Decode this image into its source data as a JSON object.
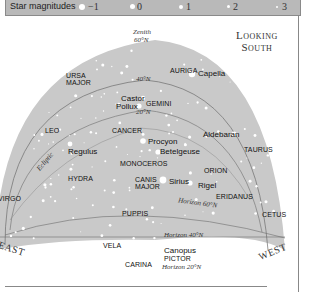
{
  "legend": {
    "title": "Star magnitudes",
    "items": [
      {
        "label": "−1",
        "magnitude": -1
      },
      {
        "label": "0",
        "magnitude": 0
      },
      {
        "label": "1",
        "magnitude": 1
      },
      {
        "label": "2",
        "magnitude": 2
      },
      {
        "label": "3",
        "magnitude": 3
      }
    ]
  },
  "view": {
    "title_line1": "Looking",
    "title_line2": "South"
  },
  "directions": {
    "east": "EAST",
    "west": "WEST"
  },
  "reference_lines": {
    "zenith": "Zenith",
    "zenith_lat": "60°N",
    "lat40": "40°N",
    "lat20": "20°N",
    "ecliptic": "Ecliptic",
    "horizon60": "Horizon 60°N",
    "horizon40": "Horizon 40°N",
    "horizon20": "Horizon 20°N"
  },
  "constellations": {
    "ursa_major_1": "URSA",
    "ursa_major_2": "MAJOR",
    "auriga": "AURIGA",
    "gemini": "GEMINI",
    "leo": "LEO",
    "cancer": "CANCER",
    "taurus": "TAURUS",
    "monoceros": "MONOCEROS",
    "orion": "ORION",
    "hydra": "HYDRA",
    "canis_major_1": "CANIS",
    "canis_major_2": "MAJOR",
    "eridanus": "ERIDANUS",
    "virgo": "VIRGO",
    "puppis": "PUPPIS",
    "cetus": "CETUS",
    "vela": "VELA",
    "pictor": "PICTOR",
    "carina": "CARINA"
  },
  "stars": {
    "capella": "Capella",
    "castor": "Castor",
    "pollux": "Pollux",
    "procyon": "Procyon",
    "betelgeuse": "Betelgeuse",
    "aldebaran": "Aldebaran",
    "regulus": "Regulus",
    "sirius": "Sirius",
    "rigel": "Rigel",
    "canopus": "Canopus"
  },
  "colors": {
    "sky": "#c9c9c9",
    "legend_bar": "#b9b9b9",
    "star": "#ffffff",
    "line": "#6d6d6d"
  }
}
